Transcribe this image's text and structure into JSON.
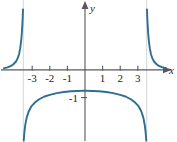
{
  "figure": {
    "name": "function-graph",
    "background": "#ffffff",
    "curve_color": "#2e6e8e",
    "axis_color": "#58585b",
    "asymptote_color": "#d9dde0",
    "text_color": "#231f20"
  },
  "axes": {
    "x_label": "x",
    "y_label": "y",
    "x_ticks": [
      "-3",
      "-2",
      "-1",
      "1",
      "2",
      "3"
    ],
    "x_tick_values": [
      -3,
      -2,
      -1,
      1,
      2,
      3
    ],
    "y_ticks": [
      "-1"
    ],
    "y_tick_values": [
      -1
    ]
  },
  "chart_data": {
    "type": "line",
    "title": "",
    "xlabel": "x",
    "ylabel": "y",
    "xlim": [
      -4.6,
      4.6
    ],
    "ylim": [
      -2.6,
      2.3
    ],
    "grid": false,
    "legend": null,
    "asymptotes": {
      "vertical": [
        -3.5,
        3.5
      ]
    },
    "series": [
      {
        "name": "left-branch",
        "comment": "x < -3.5, decreasing toward 0 as x goes left, rising to +inf at x = -3.5",
        "x": [
          -4.6,
          -4.4,
          -4.2,
          -4.05,
          -3.92,
          -3.82,
          -3.74,
          -3.68,
          -3.63,
          -3.59,
          -3.56,
          -3.54,
          -3.53,
          -3.52
        ],
        "y": [
          0.06,
          0.09,
          0.14,
          0.21,
          0.3,
          0.42,
          0.58,
          0.78,
          1.02,
          1.3,
          1.6,
          1.85,
          2.02,
          2.18
        ]
      },
      {
        "name": "middle-branch",
        "comment": "-3.5 < x < 3.5, downward arch peaking just below y = 0 at x = 0, falling to -inf at both asymptotes",
        "x": [
          -3.48,
          -3.45,
          -3.4,
          -3.32,
          -3.2,
          -3.05,
          -2.85,
          -2.6,
          -2.3,
          -2.0,
          -1.6,
          -1.2,
          -0.8,
          -0.4,
          0.0,
          0.4,
          0.8,
          1.2,
          1.6,
          2.0,
          2.3,
          2.6,
          2.85,
          3.05,
          3.2,
          3.32,
          3.4,
          3.45,
          3.48
        ],
        "y": [
          -2.55,
          -2.3,
          -2.02,
          -1.74,
          -1.5,
          -1.32,
          -1.18,
          -1.06,
          -0.96,
          -0.9,
          -0.84,
          -0.8,
          -0.77,
          -0.76,
          -0.75,
          -0.76,
          -0.77,
          -0.8,
          -0.84,
          -0.9,
          -0.96,
          -1.06,
          -1.18,
          -1.32,
          -1.5,
          -1.74,
          -2.02,
          -2.3,
          -2.55
        ]
      },
      {
        "name": "right-branch",
        "comment": "x > 3.5, falling from +inf at x = 3.5 toward 0 as x increases",
        "x": [
          3.52,
          3.53,
          3.54,
          3.56,
          3.59,
          3.63,
          3.68,
          3.74,
          3.82,
          3.92,
          4.05,
          4.2,
          4.4,
          4.6
        ],
        "y": [
          2.18,
          2.02,
          1.85,
          1.6,
          1.3,
          1.02,
          0.78,
          0.58,
          0.42,
          0.3,
          0.21,
          0.14,
          0.09,
          0.06
        ]
      }
    ]
  }
}
